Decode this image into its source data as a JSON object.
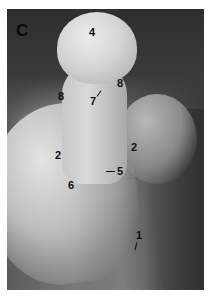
{
  "figure": {
    "panel_letter": "C",
    "labels": [
      {
        "id": "label-4",
        "text": "4",
        "x": 89,
        "y": 27
      },
      {
        "id": "label-8-left",
        "text": "8",
        "x": 58,
        "y": 91
      },
      {
        "id": "label-8-right",
        "text": "8",
        "x": 117,
        "y": 78
      },
      {
        "id": "label-7",
        "text": "7",
        "x": 90,
        "y": 96
      },
      {
        "id": "label-2-left",
        "text": "2",
        "x": 55,
        "y": 150
      },
      {
        "id": "label-2-right",
        "text": "2",
        "x": 131,
        "y": 142
      },
      {
        "id": "label-5",
        "text": "5",
        "x": 117,
        "y": 166
      },
      {
        "id": "label-6",
        "text": "6",
        "x": 68,
        "y": 180
      },
      {
        "id": "label-1",
        "text": "1",
        "x": 136,
        "y": 230
      }
    ],
    "colors": {
      "label": "#111111",
      "background": "#ffffff"
    }
  }
}
